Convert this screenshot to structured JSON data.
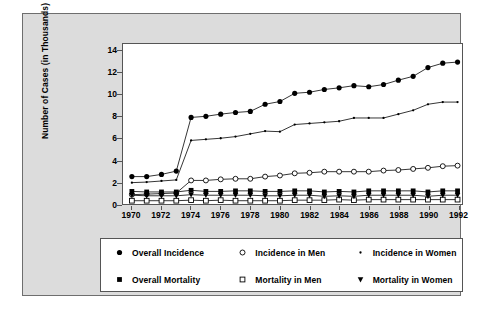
{
  "figure": {
    "background_color": "#dcdcdc",
    "plot_background_color": "#ffffff",
    "frame_color": "#555555"
  },
  "chart_data": {
    "type": "line",
    "title": "",
    "xlabel": "",
    "ylabel": "Number of Cases (in Thousands)",
    "xlim": [
      1969.4,
      1992.3
    ],
    "ylim": [
      0,
      14.6
    ],
    "yticks": [
      0,
      2,
      4,
      6,
      8,
      10,
      12,
      14
    ],
    "ytick_labels": [
      "0",
      "2",
      "4",
      "6",
      "8",
      "10",
      "12",
      "14"
    ],
    "xticks": [
      1970,
      1972,
      1974,
      1976,
      1978,
      1980,
      1982,
      1984,
      1986,
      1988,
      1990,
      1992
    ],
    "xtick_labels": [
      "1970",
      "1972",
      "1974",
      "1976",
      "1978",
      "1980",
      "1982",
      "1984",
      "1986",
      "1988",
      "1990",
      "1992"
    ],
    "grid": false,
    "legend_position": "below",
    "x": [
      1970,
      1971,
      1972,
      1973,
      1974,
      1975,
      1976,
      1977,
      1978,
      1979,
      1980,
      1981,
      1982,
      1983,
      1984,
      1985,
      1986,
      1987,
      1988,
      1989,
      1990,
      1991,
      1992
    ],
    "series": [
      {
        "name": "Overall Incidence",
        "marker": "filled-circle",
        "color": "#000000",
        "values": [
          2.5,
          2.5,
          2.7,
          3.0,
          7.9,
          8.0,
          8.2,
          8.35,
          8.45,
          9.1,
          9.35,
          10.1,
          10.2,
          10.45,
          10.6,
          10.8,
          10.7,
          10.9,
          11.3,
          11.65,
          12.45,
          12.85,
          12.95
        ]
      },
      {
        "name": "Incidence in Women",
        "marker": "small-dot",
        "color": "#000000",
        "values": [
          1.95,
          2.0,
          2.1,
          2.2,
          5.8,
          5.9,
          6.0,
          6.15,
          6.4,
          6.65,
          6.6,
          7.25,
          7.35,
          7.45,
          7.55,
          7.85,
          7.85,
          7.85,
          8.2,
          8.55,
          9.1,
          9.3,
          9.3
        ]
      },
      {
        "name": "Incidence in Men",
        "marker": "open-circle",
        "color": "#000000",
        "values": [
          0.85,
          0.9,
          0.95,
          1.0,
          2.15,
          2.15,
          2.25,
          2.3,
          2.3,
          2.5,
          2.6,
          2.8,
          2.85,
          2.95,
          2.95,
          2.95,
          2.95,
          3.05,
          3.1,
          3.2,
          3.3,
          3.45,
          3.5
        ]
      },
      {
        "name": "Overall Mortality",
        "marker": "filled-square",
        "color": "#000000",
        "values": [
          1.15,
          1.1,
          1.1,
          1.1,
          1.25,
          1.15,
          1.15,
          1.2,
          1.2,
          1.15,
          1.15,
          1.2,
          1.2,
          1.1,
          1.15,
          1.1,
          1.2,
          1.2,
          1.2,
          1.2,
          1.1,
          1.2,
          1.2
        ]
      },
      {
        "name": "Mortality in Women",
        "marker": "down-triangle",
        "color": "#000000",
        "values": [
          0.8,
          0.75,
          0.75,
          0.75,
          0.85,
          0.8,
          0.8,
          0.8,
          0.8,
          0.75,
          0.75,
          0.8,
          0.8,
          0.7,
          0.75,
          0.7,
          0.8,
          0.8,
          0.8,
          0.8,
          0.7,
          0.8,
          0.8
        ]
      },
      {
        "name": "Mortality in Men",
        "marker": "open-square",
        "color": "#000000",
        "values": [
          0.3,
          0.3,
          0.3,
          0.3,
          0.35,
          0.3,
          0.35,
          0.3,
          0.3,
          0.3,
          0.3,
          0.35,
          0.35,
          0.35,
          0.4,
          0.35,
          0.4,
          0.4,
          0.4,
          0.4,
          0.4,
          0.4,
          0.4
        ]
      }
    ]
  },
  "legend": {
    "rows": [
      [
        {
          "label": "Overall Incidence",
          "marker": "filled-circle"
        },
        {
          "label": "Incidence in Men",
          "marker": "open-circle"
        },
        {
          "label": "Incidence in Women",
          "marker": "small-dot"
        }
      ],
      [
        {
          "label": "Overall Mortality",
          "marker": "filled-square"
        },
        {
          "label": "Mortality in Men",
          "marker": "open-square"
        },
        {
          "label": "Mortality in Women",
          "marker": "down-triangle"
        }
      ]
    ]
  }
}
